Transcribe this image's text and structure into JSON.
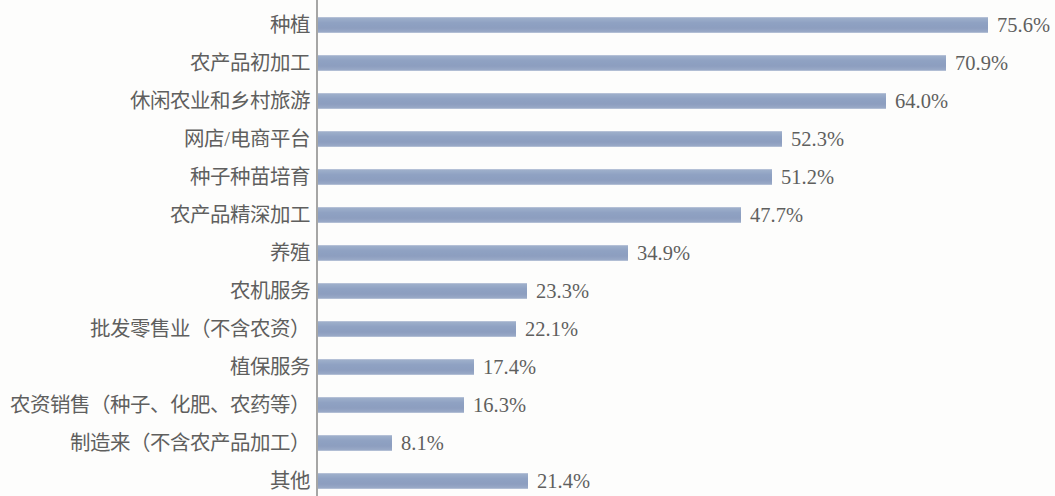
{
  "chart_data": {
    "type": "bar",
    "orientation": "horizontal",
    "title": "",
    "subtitle": "",
    "xlabel": "",
    "ylabel": "",
    "grid": false,
    "legend": false,
    "axis_line": "vertical-left",
    "value_label_suffix": "%",
    "xlim": [
      0,
      75.6
    ],
    "bar_color": "#6f88b4",
    "text_color": "#2b2b2b",
    "categories": [
      "种植",
      "农产品初加工",
      "休闲农业和乡村旅游",
      "网店/电商平台",
      "种子种苗培育",
      "农产品精深加工",
      "养殖",
      "农机服务",
      "批发零售业（不含农资）",
      "植保服务",
      "农资销售（种子、化肥、农药等）",
      "制造来（不含农产品加工）",
      "其他"
    ],
    "values": [
      75.6,
      70.9,
      64.0,
      52.3,
      51.2,
      47.7,
      34.9,
      23.3,
      22.1,
      17.4,
      16.3,
      8.1,
      21.4
    ],
    "value_labels": [
      "75.6%",
      "70.9%",
      "64.0%",
      "52.3%",
      "51.2%",
      "47.7%",
      "34.9%",
      "23.3%",
      "22.1%",
      "17.4%",
      "16.3%",
      "8.1%",
      "21.4%"
    ],
    "bar_pixel_widths": [
      670,
      628,
      568,
      464,
      454,
      423,
      310,
      209,
      198,
      156,
      146,
      74,
      210
    ]
  }
}
